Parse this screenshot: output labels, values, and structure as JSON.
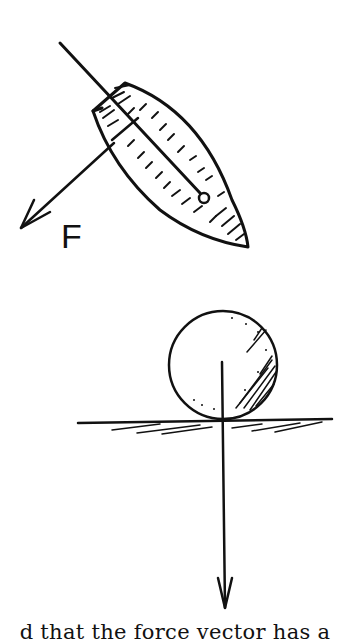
{
  "figure_top": {
    "label": "F",
    "description": "boat (sail) with line and force vector F"
  },
  "figure_bottom": {
    "description": "ball resting on ground with downward force vector"
  },
  "caption": {
    "text": "d that the force vector has a"
  },
  "colors": {
    "ink": "#111111",
    "background": "#ffffff"
  }
}
